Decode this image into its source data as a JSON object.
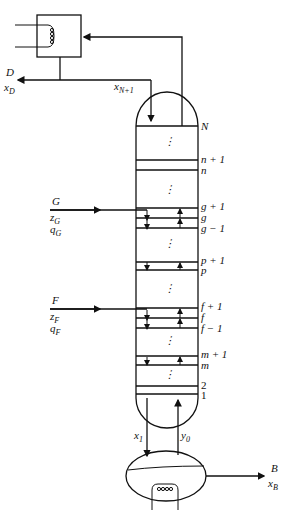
{
  "diagram": {
    "distillate": {
      "name": "D",
      "composition": "x_D"
    },
    "reflux": {
      "composition": "x_N+1"
    },
    "feeds": [
      {
        "name": "G",
        "z": "z_G",
        "q": "q_G"
      },
      {
        "name": "F",
        "z": "z_F",
        "q": "q_F"
      }
    ],
    "bottoms": {
      "name": "B",
      "composition": "x_B"
    },
    "reboiler_streams": {
      "liquid": "x_1",
      "vapor": "y_0"
    },
    "tray_labels": [
      "N",
      "n + 1",
      "n",
      "g + 1",
      "g",
      "g − 1",
      "p + 1",
      "p",
      "f + 1",
      "f",
      "f − 1",
      "m + 1",
      "m",
      "2",
      "1"
    ],
    "ellipsis": "⋮"
  },
  "labels": {
    "D": "D",
    "xD": "x",
    "xD_sub": "D",
    "xN1": "x",
    "xN1_sub": "N+1",
    "G": "G",
    "zG": "z",
    "zG_sub": "G",
    "qG": "q",
    "qG_sub": "G",
    "F": "F",
    "zF": "z",
    "zF_sub": "F",
    "qF": "q",
    "qF_sub": "F",
    "B": "B",
    "xB": "x",
    "xB_sub": "B",
    "x1": "x",
    "x1_sub": "1",
    "y0": "y",
    "y0_sub": "0",
    "N": "N",
    "n1": "n + 1",
    "n": "n",
    "g1": "g + 1",
    "g": "g",
    "gm1": "g − 1",
    "p1": "p + 1",
    "p": "p",
    "f1": "f + 1",
    "f": "f",
    "fm1": "f − 1",
    "m1": "m + 1",
    "m": "m",
    "t2": "2",
    "t1": "1",
    "dots": "⋮"
  }
}
